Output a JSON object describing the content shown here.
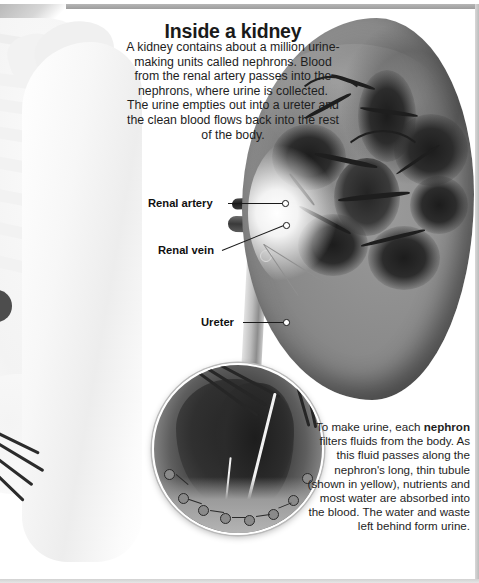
{
  "figure": {
    "title": "Inside a kidney",
    "intro": "A kidney contains about a million urine-making units called nephrons. Blood from the renal artery passes into the nephrons, where urine is collected. The urine empties out into a ureter and the clean blood flows back into the rest of the body.",
    "caption_prefix": "To make urine, each ",
    "caption_bold": "nephron",
    "caption_suffix": " filters fluids from the body. As this fluid passes along the nephron's long, thin tubule (shown in yellow), nutrients and most water are absorbed into the blood. The water and waste left behind form urine."
  },
  "labels": [
    {
      "id": "renal-artery",
      "text": "Renal artery"
    },
    {
      "id": "renal-vein",
      "text": "Renal vein"
    },
    {
      "id": "ureter",
      "text": "Ureter"
    }
  ],
  "illustration": {
    "kidney_alt": "kidney-cross-section",
    "inset_alt": "nephron-magnified-inset",
    "body_alt": "human-arm-skeleton-xray"
  },
  "colors": {
    "background": "#ffffff",
    "text": "#1e1e1e",
    "title": "#1a1a1a",
    "frame": "#b6b6b6",
    "tissue_light": "#9a9a9a",
    "tissue_dark": "#1e1e1e",
    "skeleton": "#f1f1f1"
  }
}
